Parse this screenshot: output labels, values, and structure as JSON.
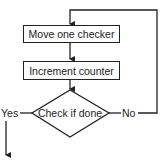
{
  "flowchart": {
    "steps": [
      {
        "id": "move",
        "label": "Move one checker",
        "shape": "rectangle"
      },
      {
        "id": "increment",
        "label": "Increment counter",
        "shape": "rectangle"
      },
      {
        "id": "check",
        "label": "Check if done",
        "shape": "diamond"
      }
    ],
    "branches": {
      "yes_label": "Yes",
      "no_label": "No"
    },
    "edges": [
      {
        "from": "move",
        "to": "increment"
      },
      {
        "from": "increment",
        "to": "check"
      },
      {
        "from": "check",
        "to": "exit",
        "label": "Yes"
      },
      {
        "from": "check",
        "to": "move",
        "label": "No"
      }
    ],
    "line_color": "#222222"
  }
}
